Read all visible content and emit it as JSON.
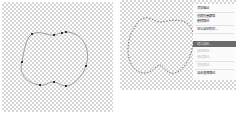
{
  "left_panel": {
    "description": "path with anchor points",
    "anchor_points": [
      [
        32,
        34
      ],
      [
        54,
        35
      ],
      [
        62,
        33
      ],
      [
        66,
        32
      ],
      [
        22,
        62
      ],
      [
        86,
        66
      ],
      [
        40,
        85
      ],
      [
        54,
        82
      ],
      [
        66,
        86
      ]
    ],
    "path_color": "#8a8a8a",
    "anchor_color": "#333333"
  },
  "right_panel": {
    "description": "path selection with marching ants",
    "selection_color": "#666666"
  },
  "context_menu": {
    "items": [
      {
        "label": "添加锚点",
        "state": "normal"
      },
      {
        "label": "创建矢量蒙版",
        "state": "normal"
      },
      {
        "label": "删除路径",
        "state": "normal"
      },
      {
        "label": "定义自定形状...",
        "state": "normal"
      },
      {
        "label": "建立选区...",
        "state": "highlighted"
      },
      {
        "label": "填充路径...",
        "state": "disabled"
      },
      {
        "label": "描边路径...",
        "state": "disabled"
      },
      {
        "label": "剪贴路径...",
        "state": "disabled"
      },
      {
        "label": "自由变换路径",
        "state": "normal"
      }
    ],
    "highlight_color": "#6b6b6b"
  }
}
